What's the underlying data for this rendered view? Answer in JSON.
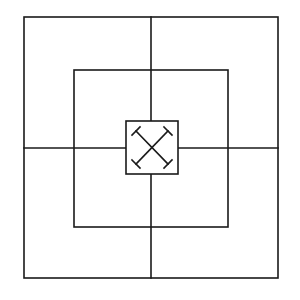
{
  "board": {
    "type": "three-concentric-squares-board",
    "background": "#ffffff",
    "line_color": "#1a1a1a",
    "line_width": 1.6,
    "outer_square": {
      "x": 24,
      "y": 17,
      "w": 254,
      "h": 261
    },
    "middle_square": {
      "x": 74,
      "y": 70,
      "w": 154,
      "h": 157
    },
    "center_square": {
      "x": 126,
      "y": 121,
      "w": 52,
      "h": 53
    },
    "midlines": {
      "vx": 151,
      "hy": 148
    },
    "center_icon": "crossed-hammers-icon"
  }
}
